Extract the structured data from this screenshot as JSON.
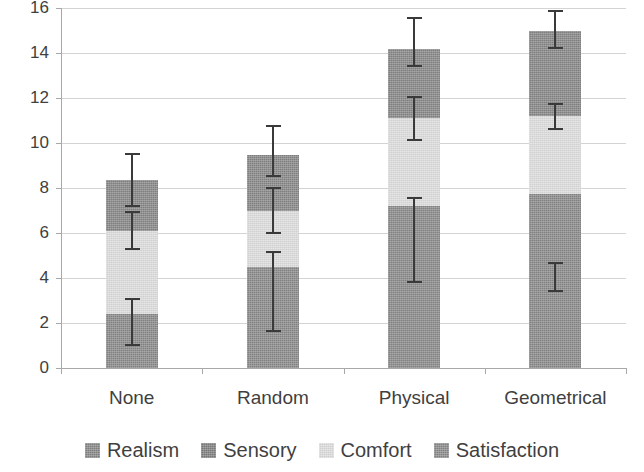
{
  "chart_data": {
    "type": "bar",
    "subtype": "stacked-bar-with-error-bars",
    "title": "",
    "xlabel": "",
    "ylabel": "",
    "ylim": [
      0,
      16
    ],
    "ytick_step": 2,
    "yticks": [
      0,
      2,
      4,
      6,
      8,
      10,
      12,
      14,
      16
    ],
    "ytick_labels": [
      "0",
      "2",
      "4",
      "6",
      "8",
      "10",
      "12",
      "14",
      "16"
    ],
    "grid": true,
    "grid_axis": "y",
    "legend_position": "bottom",
    "categories": [
      "None",
      "Random",
      "Physical",
      "Geometrical"
    ],
    "series": [
      {
        "name": "Satisfaction",
        "color": "#888888",
        "values": [
          2.4,
          4.5,
          7.2,
          7.75
        ],
        "cumulative_tops": [
          2.4,
          4.5,
          7.2,
          7.75
        ],
        "error_low": [
          1.0,
          1.6,
          3.8,
          3.4
        ],
        "error_high": [
          3.1,
          5.2,
          7.6,
          4.7
        ]
      },
      {
        "name": "Comfort",
        "color": "#dcdcdc",
        "values": [
          3.7,
          2.5,
          3.9,
          3.45
        ],
        "cumulative_tops": [
          6.1,
          7.0,
          11.1,
          11.2
        ],
        "error_low": [
          5.25,
          5.95,
          10.1,
          10.6
        ],
        "error_high": [
          7.0,
          8.05,
          12.1,
          11.8
        ]
      },
      {
        "name": "Sensory",
        "color": "#7d7d7d",
        "values": [
          0,
          0,
          0,
          0
        ],
        "cumulative_tops": [
          6.1,
          7.0,
          11.1,
          11.2
        ],
        "error_low": [
          null,
          null,
          null,
          null
        ],
        "error_high": [
          null,
          null,
          null,
          null
        ]
      },
      {
        "name": "Realism",
        "color": "#858585",
        "values": [
          2.25,
          2.45,
          3.1,
          3.8
        ],
        "cumulative_tops": [
          8.35,
          9.45,
          14.2,
          15.0
        ],
        "error_low": [
          7.15,
          8.5,
          13.4,
          14.2
        ],
        "error_high": [
          9.55,
          10.8,
          15.6,
          15.9
        ]
      }
    ],
    "totals": [
      8.35,
      9.45,
      14.2,
      15.0
    ]
  },
  "legend": {
    "items": [
      {
        "label": "Realism",
        "color": "#858585"
      },
      {
        "label": "Sensory",
        "color": "#7d7d7d"
      },
      {
        "label": "Comfort",
        "color": "#dcdcdc"
      },
      {
        "label": "Satisfaction",
        "color": "#888888"
      }
    ]
  },
  "axis": {
    "y_tick_labels": [
      "16",
      "14",
      "12",
      "10",
      "8",
      "6",
      "4",
      "2",
      "0"
    ],
    "x_tick_labels": [
      "None",
      "Random",
      "Physical",
      "Geometrical"
    ]
  },
  "colors": {
    "gridline": "#d4d4d4",
    "axis": "#a8a8a8",
    "text": "#3f3f3f",
    "error_bar": "#3a3a3a",
    "background": "#ffffff"
  }
}
